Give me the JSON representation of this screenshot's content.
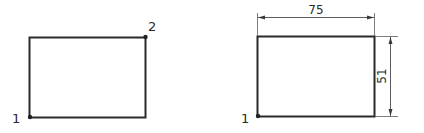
{
  "figures": [
    {
      "name": "two-point-rectangle",
      "points": [
        {
          "id": "1",
          "label": "1",
          "corner": "bottom-left"
        },
        {
          "id": "2",
          "label": "2",
          "corner": "top-right"
        }
      ]
    },
    {
      "name": "dimensioned-rectangle",
      "points": [
        {
          "id": "1",
          "label": "1",
          "corner": "bottom-left"
        }
      ],
      "dimensions": {
        "width": "75",
        "height": "51"
      }
    }
  ],
  "colors": {
    "stroke": "#2a2a2a",
    "background": "#ffffff"
  }
}
